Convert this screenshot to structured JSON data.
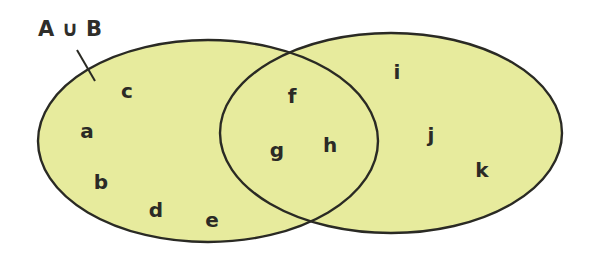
{
  "diagram": {
    "type": "venn",
    "title": "A ∪ B",
    "fill_color": "#e7eb9d",
    "stroke_color": "#2a2a24",
    "sets": [
      {
        "name": "A",
        "ellipse": {
          "cx": 208,
          "cy": 141,
          "rx": 170,
          "ry": 101
        }
      },
      {
        "name": "B",
        "ellipse": {
          "cx": 391,
          "cy": 133,
          "rx": 171,
          "ry": 100
        }
      }
    ],
    "regions": {
      "A_only": [
        "a",
        "b",
        "c",
        "d",
        "e"
      ],
      "A_and_B": [
        "f",
        "g",
        "h"
      ],
      "B_only": [
        "i",
        "j",
        "k"
      ]
    },
    "elements": [
      {
        "id": "a",
        "label": "a",
        "x": 87,
        "y": 138
      },
      {
        "id": "b",
        "label": "b",
        "x": 101,
        "y": 189
      },
      {
        "id": "c",
        "label": "c",
        "x": 127,
        "y": 98
      },
      {
        "id": "d",
        "label": "d",
        "x": 156,
        "y": 217
      },
      {
        "id": "e",
        "label": "e",
        "x": 212,
        "y": 227
      },
      {
        "id": "f",
        "label": "f",
        "x": 292,
        "y": 103
      },
      {
        "id": "g",
        "label": "g",
        "x": 277,
        "y": 157
      },
      {
        "id": "h",
        "label": "h",
        "x": 330,
        "y": 152
      },
      {
        "id": "i",
        "label": "i",
        "x": 397,
        "y": 79
      },
      {
        "id": "j",
        "label": "j",
        "x": 431,
        "y": 142
      },
      {
        "id": "k",
        "label": "k",
        "x": 482,
        "y": 177
      }
    ],
    "pointer": {
      "x1": 77,
      "y1": 50,
      "x2": 95,
      "y2": 81
    },
    "title_pos": {
      "x": 70,
      "y": 36
    }
  }
}
